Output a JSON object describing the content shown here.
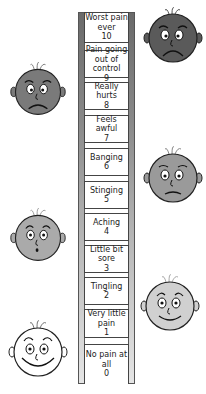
{
  "pain_scale": {
    "levels": [
      {
        "label": "Worst pain ever",
        "value": "10"
      },
      {
        "label": "Pain going out of control",
        "value": "9"
      },
      {
        "label": "Really hurts",
        "value": "8"
      },
      {
        "label": "Feels awful",
        "value": "7"
      },
      {
        "label": "Banging",
        "value": "6"
      },
      {
        "label": "Stinging",
        "value": "5"
      },
      {
        "label": "Aching",
        "value": "4"
      },
      {
        "label": "Little bit sore",
        "value": "3"
      },
      {
        "label": "Tingling",
        "value": "2"
      },
      {
        "label": "Very little pain",
        "value": "1"
      },
      {
        "label": "No pain at all",
        "value": "0"
      }
    ],
    "faces": [
      {
        "name": "face-worst-pain",
        "expression": "very-sad",
        "shade": "#5a5a5a"
      },
      {
        "name": "face-really-hurts",
        "expression": "sad",
        "shade": "#7a7a7a"
      },
      {
        "name": "face-banging",
        "expression": "frown",
        "shade": "#9a9a9a"
      },
      {
        "name": "face-aching",
        "expression": "surprised",
        "shade": "#aaaaaa"
      },
      {
        "name": "face-tingling",
        "expression": "smile",
        "shade": "#d0d0d0"
      },
      {
        "name": "face-no-pain",
        "expression": "big-smile",
        "shade": "#ffffff"
      }
    ]
  }
}
